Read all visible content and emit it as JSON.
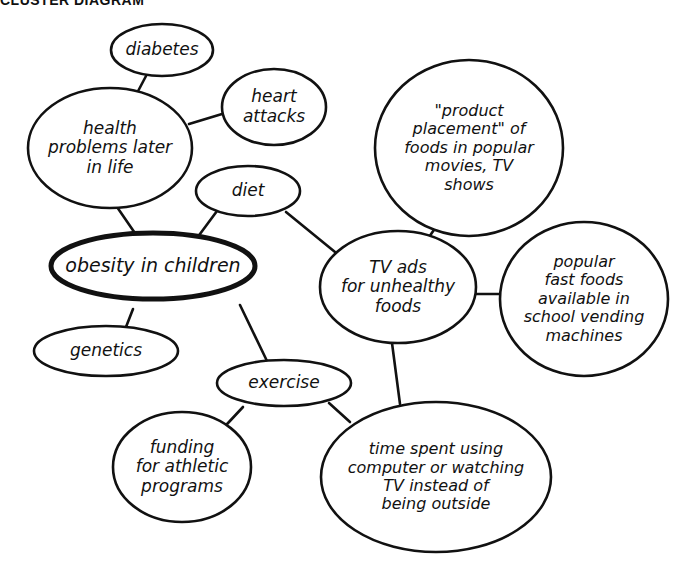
{
  "header": {
    "title": "CLUSTER DIAGRAM"
  },
  "diagram": {
    "center": "obesity in children",
    "nodes": [
      {
        "id": "diabetes",
        "label": "diabetes",
        "cx": 162,
        "cy": 50,
        "rx": 51,
        "ry": 26
      },
      {
        "id": "heart-attacks",
        "label": "heart\nattacks",
        "cx": 274,
        "cy": 107,
        "rx": 52,
        "ry": 38
      },
      {
        "id": "health-problems",
        "label": "health\nproblems later\nin life",
        "cx": 110,
        "cy": 148,
        "rx": 82,
        "ry": 60
      },
      {
        "id": "diet",
        "label": "diet",
        "cx": 248,
        "cy": 191,
        "rx": 52,
        "ry": 25
      },
      {
        "id": "obesity",
        "label": "obesity in children",
        "cx": 153,
        "cy": 266,
        "rx": 102,
        "ry": 33,
        "central": true
      },
      {
        "id": "genetics",
        "label": "genetics",
        "cx": 106,
        "cy": 351,
        "rx": 72,
        "ry": 25
      },
      {
        "id": "product-placement",
        "label": "\"product\nplacement\" of\nfoods in popular\nmovies, TV\nshows",
        "cx": 469,
        "cy": 148,
        "rx": 94,
        "ry": 88
      },
      {
        "id": "tv-ads",
        "label": "TV ads\nfor unhealthy\nfoods",
        "cx": 398,
        "cy": 287,
        "rx": 78,
        "ry": 56
      },
      {
        "id": "vending",
        "label": "popular\nfast foods\navailable in\nschool vending\nmachines",
        "cx": 584,
        "cy": 299,
        "rx": 84,
        "ry": 77
      },
      {
        "id": "exercise",
        "label": "exercise",
        "cx": 284,
        "cy": 383,
        "rx": 67,
        "ry": 23
      },
      {
        "id": "funding",
        "label": "funding\nfor athletic\nprograms",
        "cx": 182,
        "cy": 467,
        "rx": 69,
        "ry": 55
      },
      {
        "id": "time-spent",
        "label": "time spent using\ncomputer or watching\nTV instead of\nbeing outside",
        "cx": 436,
        "cy": 477,
        "rx": 115,
        "ry": 75
      }
    ],
    "edges": [
      {
        "from": "diabetes",
        "to": "health-problems",
        "x1": 146,
        "y1": 76,
        "x2": 136,
        "y2": 95
      },
      {
        "from": "heart-attacks",
        "to": "health-problems",
        "x1": 222,
        "y1": 114,
        "x2": 189,
        "y2": 124
      },
      {
        "from": "health-problems",
        "to": "obesity",
        "x1": 117,
        "y1": 207,
        "x2": 139,
        "y2": 239
      },
      {
        "from": "diet",
        "to": "obesity",
        "x1": 217,
        "y1": 211,
        "x2": 197,
        "y2": 238
      },
      {
        "from": "diet",
        "to": "tv-ads",
        "x1": 286,
        "y1": 212,
        "x2": 335,
        "y2": 252
      },
      {
        "from": "product-placement",
        "to": "tv-ads",
        "x1": 438,
        "y1": 224,
        "x2": 427,
        "y2": 240
      },
      {
        "from": "tv-ads",
        "to": "vending",
        "x1": 476,
        "y1": 294,
        "x2": 500,
        "y2": 294
      },
      {
        "from": "obesity",
        "to": "genetics",
        "x1": 133,
        "y1": 309,
        "x2": 126,
        "y2": 327
      },
      {
        "from": "obesity",
        "to": "exercise",
        "x1": 240,
        "y1": 305,
        "x2": 267,
        "y2": 361
      },
      {
        "from": "tv-ads",
        "to": "time-spent",
        "x1": 392,
        "y1": 343,
        "x2": 400,
        "y2": 404
      },
      {
        "from": "exercise",
        "to": "funding",
        "x1": 243,
        "y1": 407,
        "x2": 214,
        "y2": 438
      },
      {
        "from": "exercise",
        "to": "time-spent",
        "x1": 329,
        "y1": 403,
        "x2": 350,
        "y2": 422
      }
    ]
  }
}
